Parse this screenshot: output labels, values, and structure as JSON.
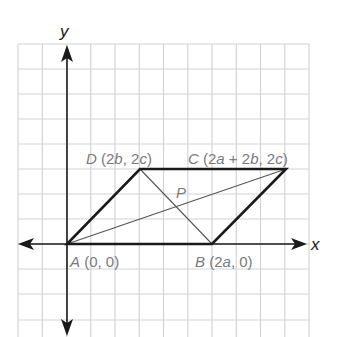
{
  "diagram": {
    "axes": {
      "x_label": "x",
      "y_label": "y"
    },
    "grid": {
      "columns": 12,
      "rows": 12,
      "line_color": "#d4d4d4",
      "axis_color": "#1a1a1a"
    },
    "vertices": [
      {
        "name": "A",
        "coords": "(0, 0)",
        "grid": [
          0,
          0
        ]
      },
      {
        "name": "B",
        "coords": "(2a, 0)",
        "grid": [
          6,
          0
        ]
      },
      {
        "name": "C",
        "coords": "(2a + 2b, 2c)",
        "grid": [
          9,
          3
        ]
      },
      {
        "name": "D",
        "coords": "(2b, 2c)",
        "grid": [
          3,
          3
        ]
      }
    ],
    "labels": {
      "A": {
        "letter": "A",
        "open": " (0, 0)"
      },
      "B": {
        "letter": "B",
        "open": " (2",
        "v1": "a",
        "close": ", 0)"
      },
      "C": {
        "letter": "C",
        "open": " (2",
        "v1": "a",
        "mid": " + 2",
        "v2": "b",
        "mid2": ", 2",
        "v3": "c",
        "close": ")"
      },
      "D": {
        "letter": "D",
        "open": " (2",
        "v1": "b",
        "mid": ", 2",
        "v2": "c",
        "close": ")"
      },
      "P": {
        "letter": "P"
      }
    },
    "diagonals": [
      "AC",
      "BD"
    ],
    "intersection": "P",
    "colors": {
      "edge": "#1a1a1a",
      "diagonal": "#555555",
      "label": "#7a7a7a"
    }
  }
}
